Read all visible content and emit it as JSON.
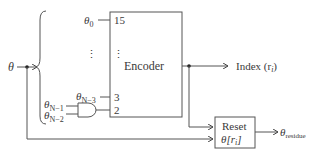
{
  "input": {
    "label": "θ"
  },
  "encoder": {
    "label": "Encoder",
    "pins": {
      "p15": "15",
      "p3": "3",
      "p2": "2",
      "dots": "⋮"
    }
  },
  "inputs": {
    "theta0": "θ",
    "theta0_sub": "0",
    "thetaN3": "θ",
    "thetaN3_sub": "N−3",
    "thetaN1": "θ",
    "thetaN1_sub": "N−1",
    "thetaN2": "θ",
    "thetaN2_sub": "N−2",
    "dots": "⋮"
  },
  "output_index": {
    "label": "Index (r",
    "sub": "i",
    "close": ")"
  },
  "reset": {
    "line1": "Reset",
    "line2": "θ[r",
    "line2_sub": "i",
    "line2_close": "]"
  },
  "residue": {
    "label": "θ",
    "sub": "residue"
  },
  "colors": {
    "line": "#555555",
    "text": "#3a3a3a"
  }
}
